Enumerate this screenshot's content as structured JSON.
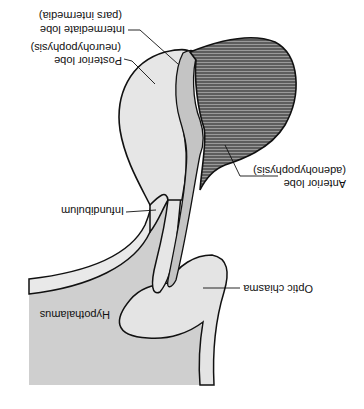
{
  "diagram": {
    "orientation": "rotated 180 degrees",
    "labels": {
      "intermediate_lobe": "Intermediate lobe",
      "intermediate_lobe_sub": "(pars intermedia)",
      "posterior_lobe": "Posterior lobe",
      "posterior_lobe_sub": "(neurohypophysis)",
      "anterior_lobe": "Anterior lobe",
      "anterior_lobe_sub": "(adenohypophysis)",
      "infundibulum": "Infundibulum",
      "hypothalamus": "Hypothalamus",
      "optic_chiasma": "Optic chiasma"
    },
    "colors": {
      "posterior_lobe": "#e6e6e6",
      "intermediate_lobe": "#c4c4c4",
      "anterior_lobe_hatch": "#333333",
      "hypothalamus": "#cfcfcf",
      "optic_chiasma": "#e4e4e4",
      "outline": "#111111"
    }
  }
}
